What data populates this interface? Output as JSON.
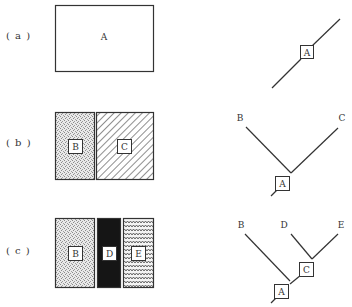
{
  "panels": [
    {
      "id": "a",
      "label": "( a )",
      "regions": [
        {
          "name": "A",
          "pattern": "blank"
        }
      ],
      "tree": {
        "leaves": [],
        "internal_nodes": [
          "A"
        ]
      }
    },
    {
      "id": "b",
      "label": "( b )",
      "regions": [
        {
          "name": "B",
          "pattern": "stipple"
        },
        {
          "name": "C",
          "pattern": "diagonal-hatch"
        }
      ],
      "tree": {
        "leaves": [
          "B",
          "C"
        ],
        "internal_nodes": [
          "A"
        ]
      }
    },
    {
      "id": "c",
      "label": "( c )",
      "regions": [
        {
          "name": "B",
          "pattern": "stipple"
        },
        {
          "name": "D",
          "pattern": "solid-black"
        },
        {
          "name": "E",
          "pattern": "wavy"
        }
      ],
      "tree": {
        "leaves": [
          "B",
          "D",
          "E"
        ],
        "internal_nodes": [
          "C",
          "A"
        ]
      }
    }
  ],
  "colors": {
    "stroke": "#333333",
    "stipple": "#9a9a9a",
    "hatch": "#444444",
    "solid": "#151515",
    "wave": "#444444"
  }
}
